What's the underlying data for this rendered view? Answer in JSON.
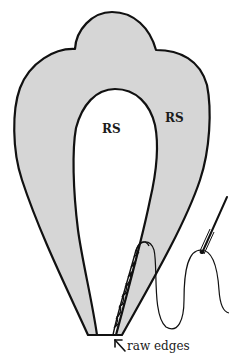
{
  "figure": {
    "type": "sewing-illustration",
    "colors": {
      "fabric_fill": "#d6d6d6",
      "outline": "#111111",
      "background": "#ffffff",
      "inner_fill": "#ffffff"
    },
    "labels": {
      "inner_rs": "RS",
      "outer_rs": "RS",
      "caption": "raw edges"
    },
    "icons": {
      "pointer": "arrow-up-left-icon",
      "needle": "needle-icon",
      "thread": "thread-icon"
    }
  }
}
